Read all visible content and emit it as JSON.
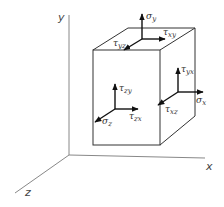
{
  "diagram": {
    "axes": {
      "x_label": "x",
      "y_label": "y",
      "z_label": "z"
    },
    "colors": {
      "line": "#333333",
      "axis": "#888888",
      "arrow": "#111111",
      "background": "#ffffff"
    },
    "faces": {
      "top": {
        "normal": {
          "symbol": "σ",
          "sub": "y"
        },
        "shear_1": {
          "symbol": "τ",
          "sub": "xy"
        },
        "shear_2": {
          "symbol": "τ",
          "sub": "yz"
        }
      },
      "front": {
        "normal": {
          "symbol": "σ",
          "sub": "z"
        },
        "shear_1": {
          "symbol": "τ",
          "sub": "zy"
        },
        "shear_2": {
          "symbol": "τ",
          "sub": "zx"
        }
      },
      "right": {
        "normal": {
          "symbol": "σ",
          "sub": "x"
        },
        "shear_1": {
          "symbol": "τ",
          "sub": "yx"
        },
        "shear_2": {
          "symbol": "τ",
          "sub": "xz"
        }
      }
    }
  }
}
